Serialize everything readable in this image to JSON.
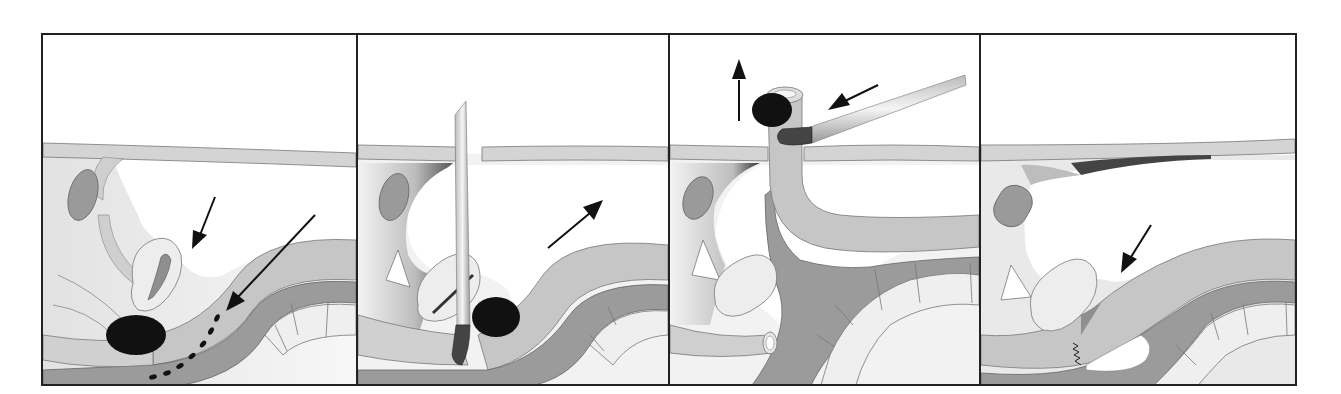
{
  "figure": {
    "type": "four-panel surgical illustration (sagittal section)",
    "panel_count": 4,
    "colors": {
      "frame": "#222222",
      "skin_layer": "#d4d4d4",
      "tissue_light": "#e6e6e6",
      "tissue_mid": "#bdbdbd",
      "tissue_dark": "#8c8c8c",
      "mass_black": "#111111",
      "instrument": "#d8d8d8",
      "bone_segments": "#efefef",
      "background": "#ffffff"
    },
    "panels": [
      {
        "index": 1,
        "description": "Dark mass near bladder/uterus region with two arrows pointing at mass and dashed track"
      },
      {
        "index": 2,
        "description": "Vertical instrument (rod) inserted through abdominal wall reaching mass; arrow pointing up-right"
      },
      {
        "index": 3,
        "description": "Tubular organ pulled up through abdominal wall with mass; angled instrument; up arrow and left-pointing arrow"
      },
      {
        "index": 4,
        "description": "Post-repair state with sutured (zigzag) closure; arrow pointing down-left"
      }
    ]
  }
}
